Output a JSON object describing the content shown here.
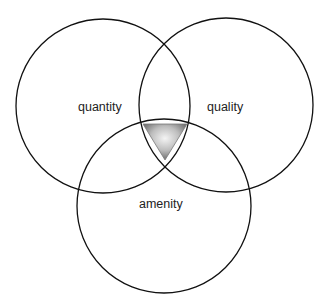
{
  "diagram": {
    "type": "venn",
    "sets": [
      {
        "id": "quantity",
        "label": "quantity"
      },
      {
        "id": "quality",
        "label": "quality"
      },
      {
        "id": "amenity",
        "label": "amenity"
      }
    ],
    "center_marker": {
      "shape": "inverted-triangle",
      "description": "shaded gray triangle marking the intersection of all three sets",
      "colors": {
        "edge": "#6e6e6e",
        "highlight": "#f2f2f2"
      }
    },
    "colors": {
      "stroke": "#111111",
      "text": "#222222",
      "background": "#ffffff"
    }
  }
}
